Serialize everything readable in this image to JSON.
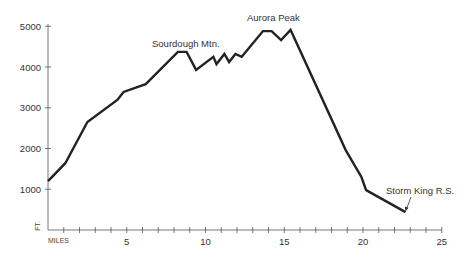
{
  "chart_data": {
    "type": "line",
    "title": "",
    "xlabel": "MILES",
    "ylabel": "FT.",
    "xlim": [
      0,
      25
    ],
    "ylim": [
      0,
      5000
    ],
    "grid": false,
    "legend": "none",
    "x_ticks": [
      5,
      10,
      15,
      20,
      25
    ],
    "x_minor_step": 1,
    "y_ticks": [
      1000,
      2000,
      3000,
      4000,
      5000
    ],
    "series": [
      {
        "name": "Elevation profile",
        "color": "#222222",
        "points": [
          [
            0,
            1200
          ],
          [
            1.1,
            1640
          ],
          [
            2.5,
            2650
          ],
          [
            4.4,
            3190
          ],
          [
            4.8,
            3390
          ],
          [
            6.2,
            3580
          ],
          [
            8.25,
            4370
          ],
          [
            8.8,
            4370
          ],
          [
            9.4,
            3930
          ],
          [
            10.5,
            4250
          ],
          [
            10.7,
            4070
          ],
          [
            11.2,
            4320
          ],
          [
            11.5,
            4120
          ],
          [
            11.9,
            4320
          ],
          [
            12.3,
            4250
          ],
          [
            13.65,
            4880
          ],
          [
            14.2,
            4880
          ],
          [
            14.8,
            4660
          ],
          [
            15.4,
            4910
          ],
          [
            18.9,
            1960
          ],
          [
            19.9,
            1300
          ],
          [
            20.2,
            980
          ],
          [
            22.7,
            440
          ]
        ]
      }
    ],
    "annotations": [
      {
        "text": "Sourdough Mtn.",
        "x": 8.5,
        "y": 4370
      },
      {
        "text": "Aurora Peak",
        "x": 14.0,
        "y": 4880
      },
      {
        "text": "Storm King R.S.",
        "x": 22.7,
        "y": 440,
        "arrow": true
      }
    ]
  },
  "labels": {
    "y_axis": "FT.",
    "x_axis": "MILES",
    "y_ticks": [
      "1000",
      "2000",
      "3000",
      "4000",
      "5000"
    ],
    "x_ticks": [
      "5",
      "10",
      "15",
      "20",
      "25"
    ],
    "annot_sourdough": "Sourdough Mtn.",
    "annot_aurora": "Aurora Peak",
    "annot_stormking": "Storm King R.S."
  }
}
